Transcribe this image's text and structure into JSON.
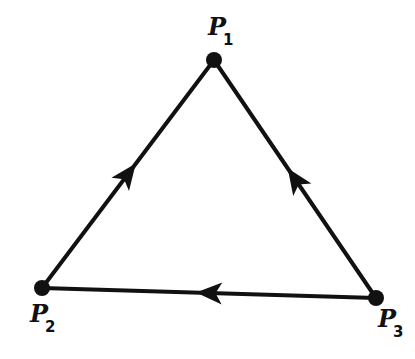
{
  "diagram": {
    "type": "directed-triangle-graph",
    "stroke_color": "#111111",
    "background": "#ffffff",
    "nodes": [
      {
        "id": "P1",
        "label": "P",
        "subscript": "1",
        "x": 214,
        "y": 60,
        "label_x": 208,
        "label_y": 35
      },
      {
        "id": "P2",
        "label": "P",
        "subscript": "2",
        "x": 42,
        "y": 288,
        "label_x": 30,
        "label_y": 322
      },
      {
        "id": "P3",
        "label": "P",
        "subscript": "3",
        "x": 376,
        "y": 298,
        "label_x": 378,
        "label_y": 327
      }
    ],
    "edges": [
      {
        "from": "P2",
        "to": "P1",
        "arrow_direction": "toward P1"
      },
      {
        "from": "P3",
        "to": "P1",
        "arrow_direction": "toward P1"
      },
      {
        "from": "P3",
        "to": "P2",
        "arrow_direction": "toward P2"
      }
    ]
  }
}
